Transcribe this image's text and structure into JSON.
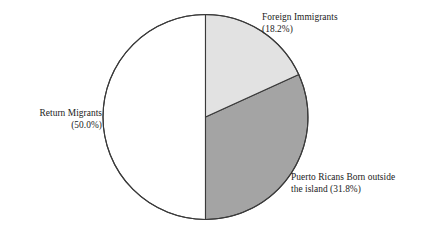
{
  "chart_data": {
    "type": "pie",
    "title": "",
    "subtitle": "",
    "xlabel": "",
    "ylabel": "",
    "legend_position": "none",
    "grid": false,
    "units": "percent",
    "total": 100.0,
    "start_angle_deg": 0,
    "direction": "clockwise",
    "categories": [
      "Return Migrants",
      "Foreign Immigrants",
      "Puerto Ricans Born outside the island"
    ],
    "values": [
      50.0,
      18.2,
      31.8
    ],
    "slices": [
      {
        "name": "Return Migrants",
        "value": 50.0,
        "value_text": "(50.0%)",
        "color": "#ffffff",
        "start_deg": 180,
        "end_deg": 360
      },
      {
        "name": "Foreign Immigrants",
        "value": 18.2,
        "value_text": "(18.2%)",
        "color": "#e2e2e2",
        "start_deg": 0,
        "end_deg": 65.52
      },
      {
        "name": "Puerto Ricans Born outside the island",
        "value": 31.8,
        "value_text": "(31.8%)",
        "color": "#a4a4a4",
        "start_deg": 65.52,
        "end_deg": 180
      }
    ],
    "annotations": [
      {
        "id": "return-migrants",
        "text": "Return Migrants\n(50.0%)",
        "align": "right"
      },
      {
        "id": "foreign-immigrants",
        "text": "Foreign Immigrants\n(18.2%)",
        "align": "left"
      },
      {
        "id": "puerto-ricans",
        "text": "Puerto Ricans Born outside\nthe island (31.8%)",
        "align": "left"
      }
    ]
  },
  "figure": {
    "background_color": "#ffffff",
    "outline_color": "#3a3a3a",
    "center_x": 205.5,
    "center_y": 117,
    "radius": 102.5
  },
  "labels": {
    "return_migrants": "Return Migrants\n(50.0%)",
    "foreign_immigrants": "Foreign Immigrants\n(18.2%)",
    "puerto_ricans": "Puerto Ricans Born outside\nthe island (31.8%)"
  }
}
